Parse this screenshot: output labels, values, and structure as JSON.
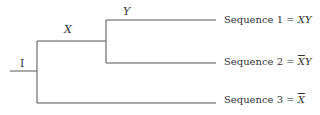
{
  "diagram": {
    "type": "event-tree",
    "initiator": {
      "label": "I"
    },
    "branches": [
      {
        "label": "X"
      },
      {
        "label": "Y"
      }
    ],
    "sequences": [
      {
        "prefix": "Sequence 1 = ",
        "terms": [
          {
            "text": "X",
            "bar": false
          },
          {
            "text": "Y",
            "bar": false
          }
        ]
      },
      {
        "prefix": "Sequence 2 = ",
        "terms": [
          {
            "text": "X",
            "bar": true
          },
          {
            "text": "Y",
            "bar": false
          }
        ]
      },
      {
        "prefix": "Sequence 3 = ",
        "terms": [
          {
            "text": "X",
            "bar": true
          }
        ]
      }
    ],
    "line_color": "#555555"
  }
}
